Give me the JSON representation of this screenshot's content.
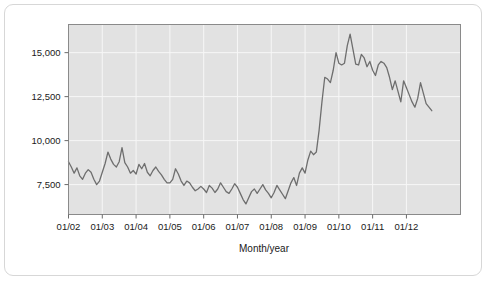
{
  "figure": {
    "background_color": "#ffffff",
    "frame_color": "#d7d7d7"
  },
  "chart_data": {
    "type": "line",
    "title": "",
    "subtitle": "",
    "xlabel": "Month/year",
    "ylabel": "",
    "grid": true,
    "legend": "none",
    "plot_background_color": "#e2e2e2",
    "gridline_color": "#f7f7f7",
    "line_color": "#6e6e6e",
    "line_width": 1.3,
    "xlim": [
      "01/02",
      "10/12"
    ],
    "ylim": [
      5800,
      16600
    ],
    "yticks": [
      7500,
      10000,
      12500,
      15000
    ],
    "ytick_labels": [
      "7,500",
      "10,000",
      "12,500",
      "15,000"
    ],
    "xticks": [
      "01/02",
      "01/03",
      "01/04",
      "01/05",
      "01/06",
      "01/07",
      "01/08",
      "01/09",
      "01/10",
      "01/11",
      "01/12"
    ],
    "xtick_labels": [
      "01/02",
      "01/03",
      "01/04",
      "01/05",
      "01/06",
      "01/07",
      "01/08",
      "01/09",
      "01/10",
      "01/11",
      "01/12"
    ],
    "series": [
      {
        "name": "monthly value",
        "x": [
          "01/02",
          "02/02",
          "03/02",
          "04/02",
          "05/02",
          "06/02",
          "07/02",
          "08/02",
          "09/02",
          "10/02",
          "11/02",
          "12/02",
          "01/03",
          "02/03",
          "03/03",
          "04/03",
          "05/03",
          "06/03",
          "07/03",
          "08/03",
          "09/03",
          "10/03",
          "11/03",
          "12/03",
          "01/04",
          "02/04",
          "03/04",
          "04/04",
          "05/04",
          "06/04",
          "07/04",
          "08/04",
          "09/04",
          "10/04",
          "11/04",
          "12/04",
          "01/05",
          "02/05",
          "03/05",
          "04/05",
          "05/05",
          "06/05",
          "07/05",
          "08/05",
          "09/05",
          "10/05",
          "11/05",
          "12/05",
          "01/06",
          "02/06",
          "03/06",
          "04/06",
          "05/06",
          "06/06",
          "07/06",
          "08/06",
          "09/06",
          "10/06",
          "11/06",
          "12/06",
          "01/07",
          "02/07",
          "03/07",
          "04/07",
          "05/07",
          "06/07",
          "07/07",
          "08/07",
          "09/07",
          "10/07",
          "11/07",
          "12/07",
          "01/08",
          "02/08",
          "03/08",
          "04/08",
          "05/08",
          "06/08",
          "07/08",
          "08/08",
          "09/08",
          "10/08",
          "11/08",
          "12/08",
          "01/09",
          "02/09",
          "03/09",
          "04/09",
          "05/09",
          "06/09",
          "07/09",
          "08/09",
          "09/09",
          "10/09",
          "11/09",
          "12/09",
          "01/10",
          "02/10",
          "03/10",
          "04/10",
          "05/10",
          "06/10",
          "07/10",
          "08/10",
          "09/10",
          "10/10",
          "11/10",
          "12/10",
          "01/11",
          "02/11",
          "03/11",
          "04/11",
          "05/11",
          "06/11",
          "07/11",
          "08/11",
          "09/11",
          "10/11",
          "11/11",
          "12/11",
          "01/12",
          "02/12",
          "03/12",
          "04/12",
          "05/12",
          "06/12",
          "07/12",
          "08/12",
          "09/12",
          "10/12"
        ],
        "values": [
          8800,
          8500,
          8150,
          8450,
          8000,
          7800,
          8150,
          8350,
          8200,
          7800,
          7500,
          7700,
          8200,
          8700,
          9350,
          8950,
          8650,
          8500,
          8800,
          9600,
          8750,
          8500,
          8150,
          8300,
          8100,
          8650,
          8400,
          8700,
          8200,
          8000,
          8300,
          8500,
          8250,
          8050,
          7800,
          7600,
          7600,
          7800,
          8400,
          8100,
          7700,
          7450,
          7700,
          7600,
          7350,
          7150,
          7250,
          7400,
          7250,
          7050,
          7450,
          7300,
          7050,
          7250,
          7600,
          7350,
          7100,
          7000,
          7250,
          7550,
          7350,
          7000,
          6650,
          6400,
          6750,
          7100,
          7250,
          7000,
          7250,
          7500,
          7200,
          7000,
          6750,
          7050,
          7450,
          7200,
          6950,
          6700,
          7150,
          7600,
          7900,
          7450,
          8150,
          8450,
          8150,
          8900,
          9400,
          9200,
          9350,
          10600,
          12200,
          13600,
          13500,
          13300,
          14000,
          15000,
          14400,
          14300,
          14400,
          15400,
          16050,
          15200,
          14350,
          14300,
          14900,
          14700,
          14200,
          14500,
          14000,
          13700,
          14300,
          14500,
          14400,
          14150,
          13600,
          12900,
          13400,
          12800,
          12200,
          13400,
          13000,
          12600,
          12200,
          11900,
          12400,
          13300,
          12700,
          12100,
          11900,
          11700
        ]
      }
    ]
  }
}
